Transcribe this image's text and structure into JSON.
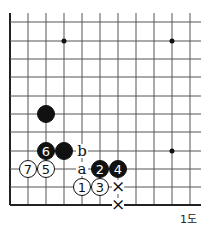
{
  "diagram": {
    "caption": "1도",
    "grid": {
      "cols_x": [
        10,
        28,
        46,
        64,
        82,
        100,
        118,
        136,
        154,
        172,
        190
      ],
      "rows_y": [
        22,
        41,
        59,
        77,
        96,
        114,
        132,
        151,
        169,
        187,
        205
      ],
      "left_edge": true,
      "bottom_edge": true,
      "right_extends_to": 201,
      "top_extends_to": 13
    },
    "star_points": [
      [
        3,
        1
      ],
      [
        9,
        1
      ],
      [
        9,
        7
      ]
    ],
    "stones": [
      {
        "col": 2,
        "row": 5,
        "color": "black",
        "label": ""
      },
      {
        "col": 2,
        "row": 7,
        "color": "black",
        "label": "6"
      },
      {
        "col": 3,
        "row": 7,
        "color": "black",
        "label": ""
      },
      {
        "col": 1,
        "row": 8,
        "color": "white",
        "label": "7"
      },
      {
        "col": 2,
        "row": 8,
        "color": "white",
        "label": "5"
      },
      {
        "col": 5,
        "row": 8,
        "color": "black",
        "label": "2"
      },
      {
        "col": 6,
        "row": 8,
        "color": "black",
        "label": "4"
      },
      {
        "col": 4,
        "row": 9,
        "color": "white",
        "label": "1"
      },
      {
        "col": 5,
        "row": 9,
        "color": "white",
        "label": "3"
      }
    ],
    "marks": [
      {
        "col": 4,
        "row": 7,
        "text": "b"
      },
      {
        "col": 4,
        "row": 8,
        "text": "a"
      },
      {
        "col": 6,
        "row": 9,
        "text": "×"
      },
      {
        "col": 6,
        "row": 10,
        "text": "×"
      }
    ],
    "colors": {
      "line": "#555555",
      "edge": "#222222",
      "black": "#111111",
      "white": "#ffffff"
    }
  }
}
